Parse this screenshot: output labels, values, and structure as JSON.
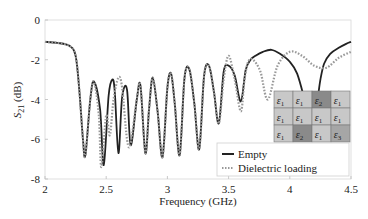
{
  "chart_data": {
    "type": "line",
    "title": "",
    "xlabel": "Frequency (GHz)",
    "ylabel": "S21 (dB)",
    "xlim": [
      2,
      4.5
    ],
    "ylim": [
      -8,
      0
    ],
    "xticks": [
      "2",
      "2.5",
      "3",
      "3.5",
      "4",
      "4.5"
    ],
    "yticks": [
      "0",
      "-2",
      "-4",
      "-6",
      "-8"
    ],
    "grid": false,
    "legend_position": "lower right",
    "series": [
      {
        "name": "Empty",
        "style": "solid",
        "color": "#222222",
        "x": [
          2.0,
          2.1,
          2.2,
          2.25,
          2.28,
          2.31,
          2.33,
          2.37,
          2.4,
          2.45,
          2.48,
          2.52,
          2.55,
          2.57,
          2.6,
          2.63,
          2.67,
          2.7,
          2.75,
          2.78,
          2.82,
          2.85,
          2.88,
          2.92,
          2.96,
          3.0,
          3.03,
          3.06,
          3.1,
          3.14,
          3.18,
          3.22,
          3.26,
          3.3,
          3.34,
          3.38,
          3.42,
          3.46,
          3.5,
          3.55,
          3.6,
          3.64,
          3.68,
          3.72,
          3.78,
          3.85,
          3.92,
          4.0,
          4.06,
          4.12,
          4.17,
          4.22,
          4.25,
          4.28,
          4.33,
          4.4,
          4.46,
          4.5
        ],
        "y": [
          -1.1,
          -1.15,
          -1.3,
          -1.8,
          -3.5,
          -6.0,
          -6.8,
          -4.0,
          -3.1,
          -4.5,
          -7.3,
          -3.8,
          -3.0,
          -3.6,
          -6.7,
          -3.9,
          -3.5,
          -6.3,
          -4.0,
          -3.3,
          -6.7,
          -4.5,
          -2.9,
          -4.6,
          -6.9,
          -3.4,
          -2.7,
          -4.2,
          -6.8,
          -2.9,
          -2.5,
          -4.2,
          -6.5,
          -2.8,
          -2.3,
          -3.6,
          -5.2,
          -2.6,
          -2.3,
          -2.8,
          -4.1,
          -2.5,
          -2.0,
          -1.8,
          -1.6,
          -1.5,
          -1.7,
          -2.1,
          -2.7,
          -4.0,
          -5.3,
          -4.2,
          -3.0,
          -2.2,
          -1.7,
          -1.4,
          -1.2,
          -1.1
        ]
      },
      {
        "name": "Dielectric loading",
        "style": "dotted",
        "color": "#999999",
        "x": [
          2.0,
          2.1,
          2.2,
          2.25,
          2.28,
          2.31,
          2.33,
          2.37,
          2.4,
          2.44,
          2.46,
          2.5,
          2.53,
          2.56,
          2.6,
          2.63,
          2.67,
          2.7,
          2.75,
          2.78,
          2.82,
          2.85,
          2.88,
          2.92,
          2.96,
          3.0,
          3.03,
          3.06,
          3.1,
          3.14,
          3.18,
          3.22,
          3.26,
          3.3,
          3.34,
          3.38,
          3.42,
          3.46,
          3.5,
          3.55,
          3.6,
          3.63,
          3.66,
          3.7,
          3.76,
          3.82,
          3.9,
          4.0,
          4.1,
          4.2,
          4.3,
          4.4,
          4.5
        ],
        "y": [
          -1.1,
          -1.15,
          -1.3,
          -1.8,
          -3.5,
          -6.0,
          -6.8,
          -4.0,
          -3.1,
          -4.8,
          -7.4,
          -4.8,
          -5.8,
          -4.0,
          -2.9,
          -3.4,
          -6.0,
          -6.2,
          -4.0,
          -3.3,
          -6.7,
          -4.5,
          -2.9,
          -4.6,
          -6.9,
          -3.4,
          -2.7,
          -4.2,
          -6.8,
          -2.9,
          -2.5,
          -4.2,
          -6.5,
          -2.8,
          -2.3,
          -3.6,
          -5.2,
          -3.0,
          -1.8,
          -3.0,
          -4.6,
          -3.0,
          -2.1,
          -2.0,
          -2.6,
          -4.0,
          -2.3,
          -1.6,
          -1.8,
          -2.3,
          -2.4,
          -1.9,
          -1.6
        ]
      }
    ],
    "inset_grid": {
      "rows": [
        [
          "ε1",
          "ε1",
          "ε2",
          "ε1"
        ],
        [
          "ε1",
          "ε1",
          "ε1",
          "ε1"
        ],
        [
          "ε1",
          "ε2",
          "ε1",
          "ε3"
        ]
      ],
      "colors": {
        "ε1": "#c8c8c8",
        "ε2": "#8a8a8a",
        "ε3": "#a6a6a6"
      }
    }
  },
  "axes": {
    "xlabel": "Frequency (GHz)",
    "ylabel_main": "S",
    "ylabel_sub": "21",
    "ylabel_unit": " (dB)"
  },
  "legend": {
    "items": [
      {
        "label": "Empty"
      },
      {
        "label": "Dielectric loading"
      }
    ]
  }
}
